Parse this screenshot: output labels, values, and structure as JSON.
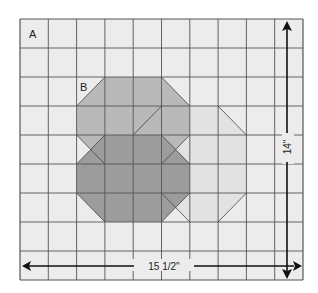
{
  "diagram": {
    "grid": {
      "cols": 10,
      "rows": 9,
      "x0": 20,
      "y0": 19,
      "cell_w": 28.3,
      "cell_h": 29.0
    },
    "labels": {
      "region_a": "A",
      "region_b": "B"
    },
    "dimensions": {
      "width_label": "15 1/2\"",
      "height_label": "14\""
    },
    "colors": {
      "background": "#ececec",
      "grid_line": "#555555",
      "light_octagon": "#e2e2e2",
      "medium_octagon": "#b9b9b9",
      "dark_octagon": "#9c9c9c",
      "arrow": "#111111"
    },
    "shapes": [
      {
        "name": "light-octagon",
        "points": [
          [
            5,
            3
          ],
          [
            7,
            3
          ],
          [
            8,
            4
          ],
          [
            8,
            6
          ],
          [
            7,
            7
          ],
          [
            6,
            7
          ],
          [
            5,
            6
          ],
          [
            4,
            6
          ],
          [
            4,
            4
          ]
        ]
      },
      {
        "name": "medium-octagon-b",
        "points": [
          [
            3,
            2
          ],
          [
            5,
            2
          ],
          [
            6,
            3
          ],
          [
            6,
            4
          ],
          [
            5,
            5
          ],
          [
            3,
            5
          ],
          [
            2,
            4
          ],
          [
            2,
            3
          ]
        ]
      },
      {
        "name": "dark-octagon",
        "points": [
          [
            3,
            4
          ],
          [
            5,
            4
          ],
          [
            6,
            5
          ],
          [
            6,
            6
          ],
          [
            5,
            7
          ],
          [
            3,
            7
          ],
          [
            2,
            6
          ],
          [
            2,
            5
          ]
        ]
      }
    ]
  }
}
